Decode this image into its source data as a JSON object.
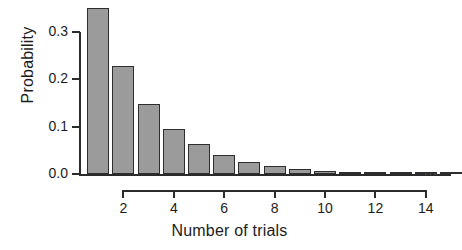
{
  "chart_data": {
    "type": "bar",
    "title": "",
    "xlabel": "Number of trials",
    "ylabel": "Probability",
    "categories": [
      1,
      2,
      3,
      4,
      5,
      6,
      7,
      8,
      9,
      10,
      11,
      12,
      13,
      14,
      15
    ],
    "values": [
      0.35,
      0.2275,
      0.1479,
      0.0961,
      0.0625,
      0.0406,
      0.0264,
      0.0172,
      0.0112,
      0.0073,
      0.0047,
      0.0031,
      0.002,
      0.0013,
      0.0008
    ],
    "xlim": [
      0.4,
      15.6
    ],
    "ylim": [
      0.0,
      0.35
    ],
    "x_ticks": [
      "2",
      "4",
      "6",
      "8",
      "10",
      "12",
      "14"
    ],
    "x_tick_values": [
      2,
      4,
      6,
      8,
      10,
      12,
      14
    ],
    "y_ticks": [
      "0.0",
      "0.1",
      "0.2",
      "0.3"
    ],
    "y_tick_values": [
      0.0,
      0.1,
      0.2,
      0.3
    ],
    "grid": false,
    "legend": false,
    "bar_fill_color": "#9b9b9b",
    "bar_edge_color": "#2e2e2e",
    "axis_color": "#2b2b2b",
    "background_color": "#ffffff",
    "annotation": "..."
  }
}
